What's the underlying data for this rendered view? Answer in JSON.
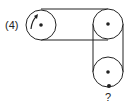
{
  "diagram": {
    "type": "pulley-belt-system",
    "problem_label": "(4)",
    "unknown_label": "?",
    "colors": {
      "stroke": "#222222",
      "background": "#ffffff"
    },
    "pulleys": [
      {
        "id": "left",
        "cx": 41,
        "cy": 25,
        "r": 15,
        "rotation_arrow": "clockwise"
      },
      {
        "id": "top-right",
        "cx": 108,
        "cy": 24,
        "r": 15
      },
      {
        "id": "bottom-right",
        "cx": 108,
        "cy": 72,
        "r": 15,
        "marker": "bottom-dot"
      }
    ],
    "belts": [
      {
        "connects": [
          "left",
          "top-right"
        ],
        "type": "open"
      },
      {
        "connects": [
          "top-right",
          "bottom-right"
        ],
        "type": "open"
      }
    ]
  }
}
